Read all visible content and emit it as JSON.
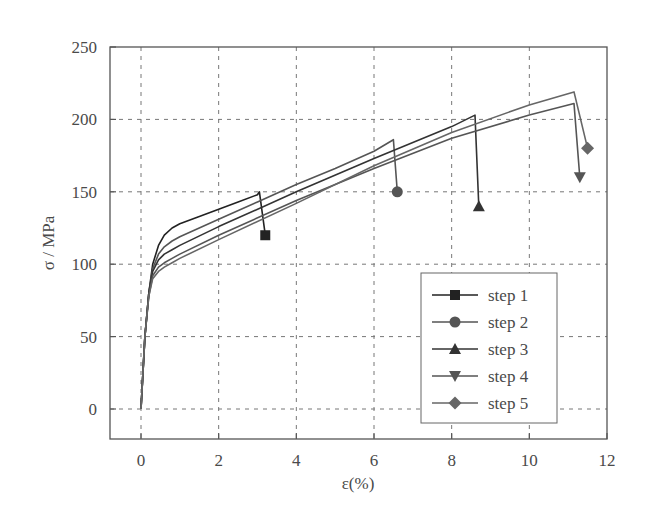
{
  "chart_data": {
    "type": "line",
    "title": "",
    "xlabel": "ε(%)",
    "ylabel": "σ / MPa",
    "xlim": [
      -0.8,
      12
    ],
    "ylim": [
      -20,
      250
    ],
    "xticks": [
      0,
      2,
      4,
      6,
      8,
      10,
      12
    ],
    "yticks": [
      0,
      50,
      100,
      150,
      200,
      250
    ],
    "grid": true,
    "grid_style": "dashed",
    "legend_position": "lower right",
    "series": [
      {
        "name": "step 1",
        "marker": "square",
        "color": "#222222",
        "x": [
          0,
          0.1,
          0.2,
          0.3,
          0.45,
          0.6,
          0.8,
          1.0,
          1.5,
          2.0,
          2.5,
          3.0,
          3.05,
          3.2
        ],
        "y": [
          0,
          50,
          80,
          100,
          113,
          120,
          125,
          128,
          133,
          138,
          143,
          148,
          150,
          120
        ]
      },
      {
        "name": "step 2",
        "marker": "circle",
        "color": "#555555",
        "x": [
          0,
          0.1,
          0.2,
          0.3,
          0.45,
          0.6,
          0.8,
          1.0,
          2.0,
          3.0,
          4.0,
          5.0,
          6.0,
          6.5,
          6.6
        ],
        "y": [
          0,
          50,
          80,
          97,
          107,
          112,
          116,
          119,
          131,
          143,
          155,
          166,
          178,
          186,
          150
        ]
      },
      {
        "name": "step 3",
        "marker": "triangle-up",
        "color": "#333333",
        "x": [
          0,
          0.1,
          0.2,
          0.3,
          0.45,
          0.6,
          0.8,
          1.0,
          2.0,
          4.0,
          6.0,
          8.0,
          8.6,
          8.7
        ],
        "y": [
          0,
          50,
          80,
          95,
          103,
          107,
          110,
          113,
          126,
          150,
          173,
          195,
          203,
          140
        ]
      },
      {
        "name": "step 4",
        "marker": "triangle-down",
        "color": "#555555",
        "x": [
          0,
          0.1,
          0.2,
          0.3,
          0.45,
          0.6,
          0.8,
          1.0,
          2.0,
          4.0,
          6.0,
          8.0,
          10.0,
          11.15,
          11.3
        ],
        "y": [
          0,
          50,
          78,
          92,
          98,
          101,
          104,
          107,
          120,
          144,
          166,
          187,
          203,
          211,
          160
        ]
      },
      {
        "name": "step 5",
        "marker": "diamond",
        "color": "#666666",
        "x": [
          0,
          0.1,
          0.2,
          0.3,
          0.45,
          0.6,
          0.8,
          1.0,
          2.0,
          4.0,
          6.0,
          8.0,
          10.0,
          11.15,
          11.5
        ],
        "y": [
          0,
          50,
          78,
          90,
          95,
          98,
          101,
          104,
          117,
          142,
          168,
          191,
          210,
          219,
          180
        ]
      }
    ]
  },
  "legend": {
    "items": [
      {
        "label": "step 1"
      },
      {
        "label": "step 2"
      },
      {
        "label": "step 3"
      },
      {
        "label": "step 4"
      },
      {
        "label": "step 5"
      }
    ]
  },
  "axes": {
    "xlabel": "ε(%)",
    "ylabel": "σ / MPa",
    "xtick_labels": [
      "0",
      "2",
      "4",
      "6",
      "8",
      "10",
      "12"
    ],
    "ytick_labels": [
      "0",
      "50",
      "100",
      "150",
      "200",
      "250"
    ]
  }
}
